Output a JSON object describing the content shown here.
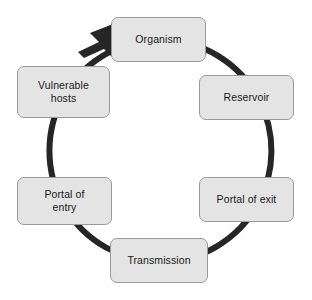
{
  "diagram": {
    "type": "cycle",
    "direction": "clockwise",
    "background_color": "#ffffff",
    "ring": {
      "color": "#262626",
      "stroke_width": 6,
      "center_x": 156,
      "center_y": 150,
      "radius": 111,
      "arrowhead": {
        "name": "clockwise-arrowhead",
        "position": "top-left",
        "points_to": "Organism",
        "color": "#262626"
      }
    },
    "box_style": {
      "fill_color": "#e4e4e4",
      "border_color": "#9a9a9a",
      "text_color": "#1a1a1a",
      "corner_radius": 7
    },
    "nodes": [
      {
        "id": "organism",
        "label": "Organism",
        "position": "top"
      },
      {
        "id": "reservoir",
        "label": "Reservoir",
        "position": "upper-right"
      },
      {
        "id": "portal-exit",
        "label": "Portal of exit",
        "position": "lower-right"
      },
      {
        "id": "transmission",
        "label": "Transmission",
        "position": "bottom"
      },
      {
        "id": "portal-entry",
        "label": "Portal of\nentry",
        "position": "lower-left"
      },
      {
        "id": "vulnerable",
        "label": "Vulnerable\nhosts",
        "position": "upper-left"
      }
    ]
  }
}
